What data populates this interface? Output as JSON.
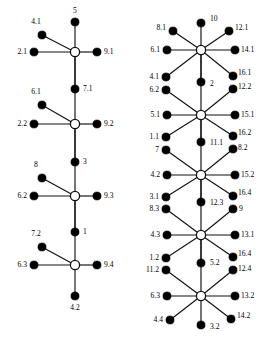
{
  "figure": {
    "type": "diagram",
    "background_color": "#ffffff",
    "leaf_color": "#000000",
    "hub_color": "#ffffff",
    "edge_color": "#111111",
    "leaf_radius": 4.1,
    "hub_radius": 4.6
  },
  "diagrams": [
    {
      "id": "left-diagram",
      "name": "left-graph",
      "hub_count": 4,
      "spokes_per_hub": 5,
      "hubs": [
        {
          "id": "L1",
          "cx": 75,
          "cy": 52,
          "leaves": [
            {
              "name": "leaf-4.1",
              "label": "4.1",
              "cx": 42,
              "cy": 35,
              "lx": 36,
              "ly": 22,
              "anchor": "c"
            },
            {
              "name": "leaf-2.1",
              "label": "2.1",
              "cx": 34,
              "cy": 52,
              "lx": 27,
              "ly": 52,
              "anchor": "r"
            },
            {
              "name": "leaf-9.1",
              "label": "9.1",
              "cx": 97,
              "cy": 52,
              "lx": 104,
              "ly": 52,
              "anchor": "l"
            },
            {
              "name": "leaf-5",
              "label": "5",
              "cx": 75,
              "cy": 22,
              "lx": 75,
              "ly": 11,
              "anchor": "c"
            },
            {
              "name": "leaf-7.1",
              "label": "7.1",
              "cx": 75,
              "cy": 89,
              "lx": 83,
              "ly": 89,
              "anchor": "l"
            }
          ]
        },
        {
          "id": "L2",
          "cx": 75,
          "cy": 124,
          "leaves": [
            {
              "name": "leaf-6.1",
              "label": "6.1",
              "cx": 42,
              "cy": 105,
              "lx": 36,
              "ly": 92,
              "anchor": "c"
            },
            {
              "name": "leaf-2.2",
              "label": "2.2",
              "cx": 34,
              "cy": 124,
              "lx": 27,
              "ly": 124,
              "anchor": "r"
            },
            {
              "name": "leaf-9.2",
              "label": "9.2",
              "cx": 97,
              "cy": 124,
              "lx": 104,
              "ly": 124,
              "anchor": "l"
            },
            {
              "name": "leaf-3",
              "label": "3",
              "cx": 75,
              "cy": 162,
              "lx": 83,
              "ly": 162,
              "anchor": "l"
            }
          ]
        },
        {
          "id": "L3",
          "cx": 75,
          "cy": 196,
          "leaves": [
            {
              "name": "leaf-8",
              "label": "8",
              "cx": 42,
              "cy": 178,
              "lx": 36,
              "ly": 165,
              "anchor": "c"
            },
            {
              "name": "leaf-6.2",
              "label": "6.2",
              "cx": 34,
              "cy": 196,
              "lx": 27,
              "ly": 196,
              "anchor": "r"
            },
            {
              "name": "leaf-9.3",
              "label": "9.3",
              "cx": 97,
              "cy": 196,
              "lx": 104,
              "ly": 196,
              "anchor": "l"
            },
            {
              "name": "leaf-1",
              "label": "1",
              "cx": 75,
              "cy": 232,
              "lx": 83,
              "ly": 232,
              "anchor": "l"
            }
          ]
        },
        {
          "id": "L4",
          "cx": 75,
          "cy": 265,
          "leaves": [
            {
              "name": "leaf-7.2",
              "label": "7.2",
              "cx": 42,
              "cy": 247,
              "lx": 36,
              "ly": 234,
              "anchor": "c"
            },
            {
              "name": "leaf-6.3",
              "label": "6.3",
              "cx": 34,
              "cy": 265,
              "lx": 27,
              "ly": 265,
              "anchor": "r"
            },
            {
              "name": "leaf-9.4",
              "label": "9.4",
              "cx": 97,
              "cy": 265,
              "lx": 104,
              "ly": 265,
              "anchor": "l"
            },
            {
              "name": "leaf-4.2",
              "label": "4.2",
              "cx": 75,
              "cy": 296,
              "lx": 75,
              "ly": 308,
              "anchor": "c"
            }
          ]
        }
      ]
    },
    {
      "id": "right-diagram",
      "name": "right-graph",
      "hub_count": 5,
      "spokes_per_hub": 8,
      "hubs": [
        {
          "id": "R1",
          "cx": 201,
          "cy": 50,
          "leaves": [
            {
              "name": "leaf-10",
              "label": "10",
              "cx": 201,
              "cy": 23,
              "lx": 210,
              "ly": 19,
              "anchor": "l"
            },
            {
              "name": "leaf-8.1",
              "label": "8.1",
              "cx": 173,
              "cy": 31,
              "lx": 166,
              "ly": 28,
              "anchor": "r"
            },
            {
              "name": "leaf-12.1",
              "label": "12.1",
              "cx": 229,
              "cy": 31,
              "lx": 235,
              "ly": 28,
              "anchor": "l"
            },
            {
              "name": "leaf-6.1r",
              "label": "6.1",
              "cx": 167,
              "cy": 50,
              "lx": 160,
              "ly": 50,
              "anchor": "r"
            },
            {
              "name": "leaf-14.1",
              "label": "14.1",
              "cx": 235,
              "cy": 50,
              "lx": 241,
              "ly": 50,
              "anchor": "l"
            },
            {
              "name": "leaf-4.1r",
              "label": "4.1",
              "cx": 166,
              "cy": 77,
              "lx": 159,
              "ly": 77,
              "anchor": "r"
            },
            {
              "name": "leaf-2r",
              "label": "2",
              "cx": 201,
              "cy": 82,
              "lx": 210,
              "ly": 84,
              "anchor": "l"
            },
            {
              "name": "leaf-16.1",
              "label": "16.1",
              "cx": 233,
              "cy": 76,
              "lx": 238,
              "ly": 73,
              "anchor": "l"
            }
          ]
        },
        {
          "id": "R2",
          "cx": 201,
          "cy": 115,
          "leaves": [
            {
              "name": "leaf-6.2r",
              "label": "6.2",
              "cx": 166,
              "cy": 90,
              "lx": 159,
              "ly": 90,
              "anchor": "r"
            },
            {
              "name": "leaf-12.2",
              "label": "12.2",
              "cx": 233,
              "cy": 89,
              "lx": 238,
              "ly": 87,
              "anchor": "l"
            },
            {
              "name": "leaf-5.1",
              "label": "5.1",
              "cx": 167,
              "cy": 115,
              "lx": 160,
              "ly": 115,
              "anchor": "r"
            },
            {
              "name": "leaf-15.1",
              "label": "15.1",
              "cx": 235,
              "cy": 115,
              "lx": 241,
              "ly": 115,
              "anchor": "l"
            },
            {
              "name": "leaf-1.1",
              "label": "1.1",
              "cx": 166,
              "cy": 137,
              "lx": 159,
              "ly": 137,
              "anchor": "r"
            },
            {
              "name": "leaf-11.1",
              "label": "11.1",
              "cx": 201,
              "cy": 142,
              "lx": 210,
              "ly": 143,
              "anchor": "l"
            },
            {
              "name": "leaf-16.2",
              "label": "16.2",
              "cx": 233,
              "cy": 136,
              "lx": 238,
              "ly": 133,
              "anchor": "l"
            }
          ]
        },
        {
          "id": "R3",
          "cx": 201,
          "cy": 175,
          "leaves": [
            {
              "name": "leaf-7r",
              "label": "7",
              "cx": 166,
              "cy": 150,
              "lx": 159,
              "ly": 150,
              "anchor": "r"
            },
            {
              "name": "leaf-8.2",
              "label": "8.2",
              "cx": 233,
              "cy": 149,
              "lx": 238,
              "ly": 148,
              "anchor": "l"
            },
            {
              "name": "leaf-4.2r",
              "label": "4.2",
              "cx": 167,
              "cy": 175,
              "lx": 160,
              "ly": 175,
              "anchor": "r"
            },
            {
              "name": "leaf-15.2",
              "label": "15.2",
              "cx": 235,
              "cy": 175,
              "lx": 241,
              "ly": 175,
              "anchor": "l"
            },
            {
              "name": "leaf-3.1",
              "label": "3.1",
              "cx": 166,
              "cy": 197,
              "lx": 159,
              "ly": 197,
              "anchor": "r"
            },
            {
              "name": "leaf-12.3",
              "label": "12.3",
              "cx": 201,
              "cy": 202,
              "lx": 210,
              "ly": 203,
              "anchor": "l"
            },
            {
              "name": "leaf-16.4a",
              "label": "16.4",
              "cx": 233,
              "cy": 196,
              "lx": 238,
              "ly": 193,
              "anchor": "l"
            }
          ]
        },
        {
          "id": "R4",
          "cx": 201,
          "cy": 235,
          "leaves": [
            {
              "name": "leaf-8.3",
              "label": "8.3",
              "cx": 166,
              "cy": 209,
              "lx": 159,
              "ly": 209,
              "anchor": "r"
            },
            {
              "name": "leaf-9r",
              "label": "9",
              "cx": 233,
              "cy": 209,
              "lx": 239,
              "ly": 209,
              "anchor": "l"
            },
            {
              "name": "leaf-4.3",
              "label": "4.3",
              "cx": 167,
              "cy": 235,
              "lx": 160,
              "ly": 235,
              "anchor": "r"
            },
            {
              "name": "leaf-13.1",
              "label": "13.1",
              "cx": 235,
              "cy": 235,
              "lx": 241,
              "ly": 235,
              "anchor": "l"
            },
            {
              "name": "leaf-1.2",
              "label": "1.2",
              "cx": 166,
              "cy": 258,
              "lx": 159,
              "ly": 258,
              "anchor": "r"
            },
            {
              "name": "leaf-5.2",
              "label": "5.2",
              "cx": 201,
              "cy": 263,
              "lx": 210,
              "ly": 263,
              "anchor": "l"
            },
            {
              "name": "leaf-16.4b",
              "label": "16.4",
              "cx": 233,
              "cy": 257,
              "lx": 238,
              "ly": 254,
              "anchor": "l"
            }
          ]
        },
        {
          "id": "R5",
          "cx": 201,
          "cy": 296,
          "leaves": [
            {
              "name": "leaf-11.2",
              "label": "11.2",
              "cx": 166,
              "cy": 270,
              "lx": 159,
              "ly": 270,
              "anchor": "r"
            },
            {
              "name": "leaf-12.4",
              "label": "12.4",
              "cx": 233,
              "cy": 270,
              "lx": 238,
              "ly": 269,
              "anchor": "l"
            },
            {
              "name": "leaf-6.3r",
              "label": "6.3",
              "cx": 167,
              "cy": 296,
              "lx": 160,
              "ly": 296,
              "anchor": "r"
            },
            {
              "name": "leaf-13.2",
              "label": "13.2",
              "cx": 235,
              "cy": 296,
              "lx": 241,
              "ly": 296,
              "anchor": "l"
            },
            {
              "name": "leaf-4.4",
              "label": "4.4",
              "cx": 170,
              "cy": 320,
              "lx": 163,
              "ly": 320,
              "anchor": "r"
            },
            {
              "name": "leaf-3.2",
              "label": "3.2",
              "cx": 201,
              "cy": 325,
              "lx": 210,
              "ly": 327,
              "anchor": "l"
            },
            {
              "name": "leaf-14.2",
              "label": "14.2",
              "cx": 231,
              "cy": 319,
              "lx": 237,
              "ly": 316,
              "anchor": "l"
            }
          ]
        }
      ]
    }
  ]
}
